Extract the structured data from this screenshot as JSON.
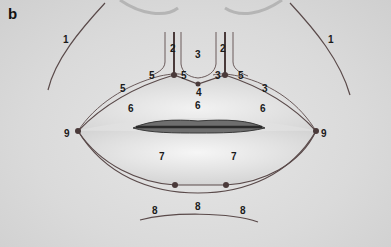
{
  "figure": {
    "panel_letter": "b",
    "line_color": "#5a4a4a",
    "dot_color": "#4a3a3a",
    "labels": {
      "l1_left": "1",
      "l1_right": "1",
      "l2_left": "2",
      "l2_right": "2",
      "l3_top": "3",
      "l3_left": "3",
      "l3_right": "3",
      "l4": "4",
      "l5_a": "5",
      "l5_b": "5",
      "l5_c": "5",
      "l5_d": "5",
      "l6_center": "6",
      "l6_left": "6",
      "l6_right": "6",
      "l7_left": "7",
      "l7_right": "7",
      "l8_left": "8",
      "l8_center": "8",
      "l8_right": "8",
      "l9_left": "9",
      "l9_right": "9"
    }
  }
}
